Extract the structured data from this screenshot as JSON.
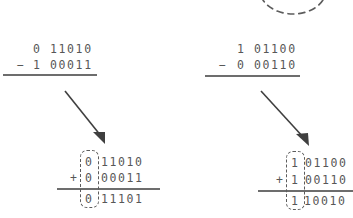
{
  "figure": {
    "ink_color": "#575757",
    "rule_color": "#6d6d6d",
    "dash_color": "#5c5c5c",
    "background": "#ffffff"
  },
  "top_ellipse": {
    "name": "dashed-ellipse-partial",
    "style": "dashed",
    "clipped": "top"
  },
  "left": {
    "subtraction": {
      "minuend_sign": "0",
      "minuend_magnitude": "11010",
      "minuend": "0 11010",
      "operator": "−",
      "subtrahend_sign": "1",
      "subtrahend_magnitude": "00011",
      "subtrahend": "1 00011"
    },
    "arrow": {
      "name": "transform-arrow",
      "direction": "down-right"
    },
    "addition": {
      "addend1_sign": "0",
      "addend1_magnitude": "11010",
      "addend1": "0 11010",
      "operator": "+",
      "addend2_sign": "0",
      "addend2_magnitude": "00011",
      "addend2": "0 00011",
      "sum_sign": "0",
      "sum_magnitude": "11101",
      "sum": "0 11101"
    }
  },
  "right": {
    "subtraction": {
      "minuend_sign": "1",
      "minuend_magnitude": "01100",
      "minuend": "1 01100",
      "operator": "−",
      "subtrahend_sign": "0",
      "subtrahend_magnitude": "00110",
      "subtrahend": "0 00110"
    },
    "arrow": {
      "name": "transform-arrow",
      "direction": "down-right"
    },
    "addition": {
      "addend1_sign": "1",
      "addend1_magnitude": "01100",
      "addend1": "1 01100",
      "operator": "+",
      "addend2_sign": "1",
      "addend2_magnitude": "00110",
      "addend2": "1 00110",
      "sum_sign": "1",
      "sum_magnitude": "10010",
      "sum": "1 10010"
    }
  }
}
